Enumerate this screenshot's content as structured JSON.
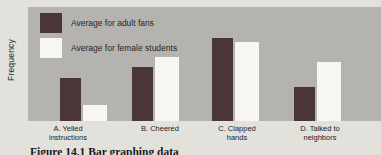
{
  "figure": {
    "ylabel": "Frequency",
    "caption": "Figure 14.1  Bar graphing data"
  },
  "legend": {
    "items": [
      {
        "label": "Average for adult fans",
        "color": "#4a3637"
      },
      {
        "label": "Average for female students",
        "color": "#f7f6f2"
      }
    ]
  },
  "chart_data": {
    "type": "bar",
    "title": "",
    "xlabel": "",
    "ylabel": "Frequency",
    "categories": [
      "A. Yelled instructions",
      "B. Cheered",
      "C. Clapped hands",
      "D. Talked to neighbors"
    ],
    "category_lines": [
      [
        "A. Yelled",
        "instructions"
      ],
      [
        "B. Cheered"
      ],
      [
        "C. Clapped",
        "hands"
      ],
      [
        "D. Talked to",
        "neighbors"
      ]
    ],
    "series": [
      {
        "name": "Average for adult fans",
        "color": "#4a3637",
        "values": [
          43,
          54,
          83,
          34
        ]
      },
      {
        "name": "Average for female students",
        "color": "#f7f6f2",
        "values": [
          16,
          64,
          79,
          59
        ]
      }
    ],
    "value_units": "relative frequency (no numeric scale shown on axis)",
    "ylim": [
      0,
      114
    ],
    "grid": false,
    "legend_position": "top-left inside plot"
  },
  "colors": {
    "plot_background": "#b5b3af",
    "page_background": "#e3e1db",
    "dark_series": "#4a3637",
    "light_series": "#f7f6f2",
    "text": "#21211f"
  }
}
